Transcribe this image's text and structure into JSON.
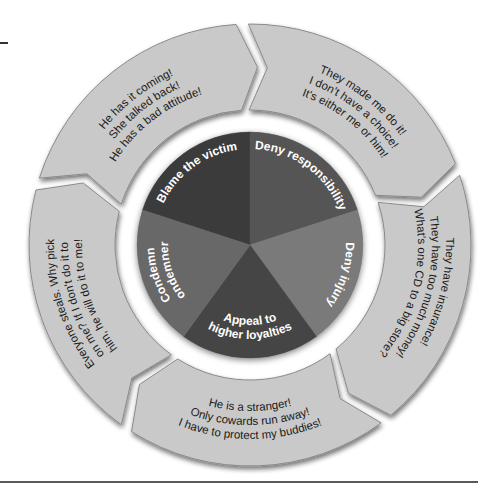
{
  "diagram": {
    "type": "cycle-wheel",
    "colors": {
      "ring_segment": "#c9c9c9",
      "ring_segment_edge": "#8a8a8a",
      "background": "#ffffff",
      "rule": "#222222",
      "pie_text": "#ffffff",
      "ring_text": "#1a1a1a"
    },
    "center_pie": [
      {
        "label": "Blame the victim",
        "color": "#3a3a3a"
      },
      {
        "label": "Deny responsibility",
        "color": "#555555"
      },
      {
        "label": "Deny injury",
        "color": "#7a7a7a"
      },
      {
        "label": "Appeal to higher loyalties",
        "line1": "Appeal to",
        "line2": "higher loyalties",
        "color": "#444444"
      },
      {
        "label": "Condemn condemners",
        "line1": "Condemn",
        "line2": "condemners",
        "color": "#686868"
      }
    ],
    "outer_ring": [
      {
        "for": "Blame the victim",
        "lines": [
          "He has it coming!",
          "She talked back!",
          "He has a bad attitude!"
        ]
      },
      {
        "for": "Deny responsibility",
        "lines": [
          "They made me do it!",
          "I don't have a choice!",
          "It's either me or him!"
        ]
      },
      {
        "for": "Deny injury",
        "lines": [
          "They have insurance!",
          "They have too much money!",
          "What's one CD to a big store?"
        ]
      },
      {
        "for": "Appeal to higher loyalties",
        "lines": [
          "He is a stranger!",
          "Only cowards run away!",
          "I have to protect my buddies!"
        ]
      },
      {
        "for": "Condemn condemners",
        "lines": [
          "Everyone steals. Why pick",
          "on me? If I don't do it to",
          "him, he will do it to me!"
        ]
      }
    ]
  }
}
